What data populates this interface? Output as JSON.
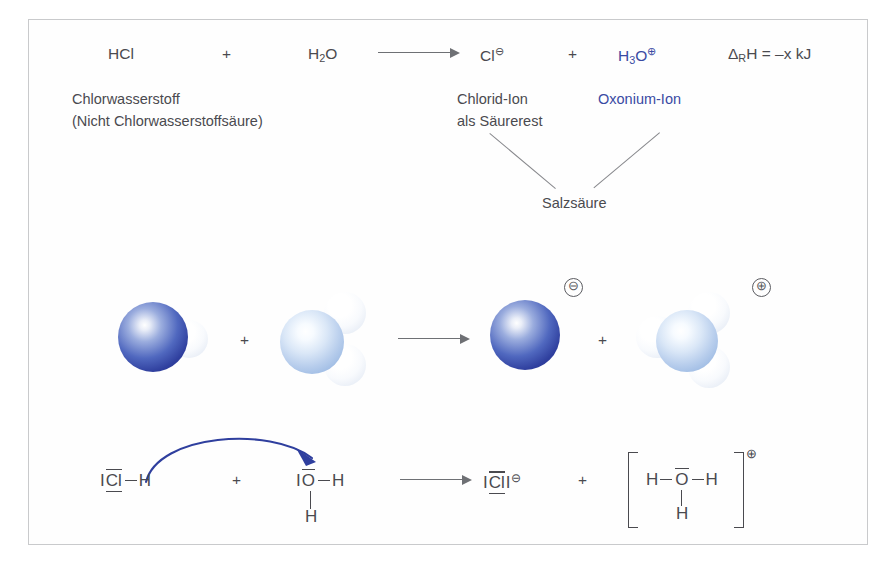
{
  "figure": {
    "border_color": "#c9cacc",
    "background": "#ffffff",
    "text_color": "#4a4a4f",
    "accent_blue": "#3a4aa3"
  },
  "equation": {
    "reactant1": {
      "formula": "HCl",
      "name_line1": "Chlorwasserstoff",
      "name_line2": "(Nicht Chlorwasserstoffsäure)"
    },
    "plus1": "+",
    "reactant2": {
      "formula_main": "H",
      "formula_sub": "2",
      "formula_tail": "O"
    },
    "arrow": "reaction-arrow",
    "product1": {
      "formula": "Cl",
      "charge": "⊖",
      "name_line1": "Chlorid-Ion",
      "name_line2": "als Säurerest"
    },
    "plus2": "+",
    "product2": {
      "formula_main": "H",
      "formula_sub": "3",
      "formula_tail": "O",
      "charge": "⊕",
      "name": "Oxonium-Ion",
      "color": "#3a4aa3"
    },
    "enthalpy": {
      "delta": "Δ",
      "sub": "R",
      "rest": "H = –x kJ"
    },
    "combined_label": "Salzsäure"
  },
  "models": {
    "hcl": {
      "label": "HCl-Molekül",
      "cl_color": "#2f3f9e",
      "h_color": "#ffffff"
    },
    "water": {
      "label": "H2O-Molekül",
      "o_color": "#9cbae3",
      "h_color": "#ffffff"
    },
    "chloride": {
      "label": "Chlorid-Ion",
      "charge": "⊖"
    },
    "hydronium": {
      "label": "Oxonium-Ion",
      "charge": "⊕"
    },
    "plus1": "+",
    "plus2": "+"
  },
  "lewis": {
    "hcl": {
      "lone_left": "I",
      "atom": "Cl",
      "bond": "–",
      "h": "H"
    },
    "plus1": "+",
    "water": {
      "lone_left": "I",
      "atom": "O",
      "bond": "–",
      "h_right": "H",
      "h_bottom": "H"
    },
    "chloride": {
      "lone_left": "I",
      "atom": "Cl",
      "lone_right": "I",
      "charge": "⊖"
    },
    "plus2": "+",
    "hydronium": {
      "h_left": "H",
      "atom": "O",
      "h_right": "H",
      "h_bottom": "H",
      "charge": "⊕",
      "bracket": "[ ]"
    },
    "electron_arrow": {
      "name": "electron-pair-transfer",
      "color": "#2f3f9e"
    }
  }
}
